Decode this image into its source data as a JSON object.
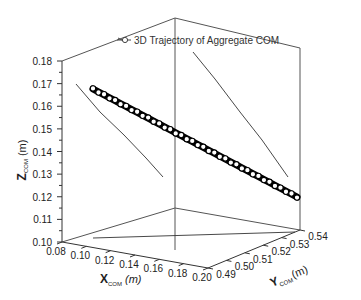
{
  "chart_data": {
    "type": "scatter3d",
    "title": "",
    "legend": {
      "entries": [
        "3D Trajectory of Aggregate COM"
      ],
      "position": "top-center",
      "marker": "open-circle-line"
    },
    "axes": {
      "x": {
        "label_main": "X",
        "label_sub": "COM",
        "label_unit": "(m)",
        "range": [
          0.08,
          0.2
        ],
        "ticks": [
          "0.08",
          "0.10",
          "0.12",
          "0.14",
          "0.16",
          "0.18",
          "0.20"
        ]
      },
      "y": {
        "label_main": "Y",
        "label_sub": "COM",
        "label_unit": "(m)",
        "range": [
          0.49,
          0.54
        ],
        "ticks": [
          "0.49",
          "0.50",
          "0.51",
          "0.52",
          "0.53",
          "0.54"
        ]
      },
      "z": {
        "label_main": "Z",
        "label_sub": "COM",
        "label_unit": "(m)",
        "range": [
          0.1,
          0.18
        ],
        "ticks": [
          "0.10",
          "0.11",
          "0.12",
          "0.13",
          "0.14",
          "0.15",
          "0.16",
          "0.17",
          "0.18"
        ]
      }
    },
    "series": [
      {
        "name": "3D Trajectory of Aggregate COM",
        "marker": "open-circle",
        "line_color": "#000000",
        "marker_fill": "#ffffff",
        "start": {
          "x": 0.085,
          "y": 0.49,
          "z": 0.168
        },
        "end": {
          "x": 0.195,
          "y": 0.537,
          "z": 0.118
        },
        "n_points": 38
      }
    ],
    "projections": {
      "xz_wall": {
        "from": [
          0.085,
          0.168
        ],
        "to": [
          0.195,
          0.118
        ]
      },
      "yz_wall": {
        "from": [
          0.49,
          0.168
        ],
        "to": [
          0.537,
          0.118
        ]
      },
      "xy_floor": {
        "from": [
          0.085,
          0.49
        ],
        "to": [
          0.195,
          0.537
        ]
      }
    },
    "grid": false
  }
}
